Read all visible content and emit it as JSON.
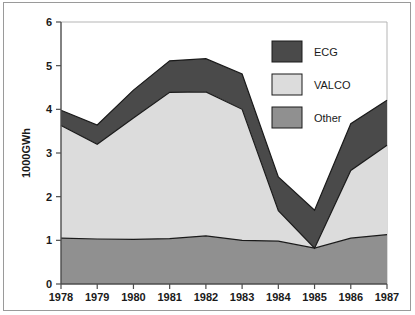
{
  "chart_data": {
    "type": "area",
    "stacked": true,
    "title": "",
    "subtitle": "",
    "xlabel": "",
    "ylabel": "1000GWh",
    "categories": [
      "1978",
      "1979",
      "1980",
      "1981",
      "1982",
      "1983",
      "1984",
      "1985",
      "1986",
      "1987"
    ],
    "x": [
      1978,
      1979,
      1980,
      1981,
      1982,
      1983,
      1984,
      1985,
      1986,
      1987
    ],
    "series": [
      {
        "name": "Other",
        "color": "#909090",
        "values": [
          1.05,
          1.03,
          1.02,
          1.04,
          1.1,
          1.0,
          0.98,
          0.82,
          1.05,
          1.13
        ]
      },
      {
        "name": "VALCO",
        "color": "#dcdcdc",
        "values": [
          2.58,
          2.17,
          2.78,
          3.35,
          3.3,
          3.0,
          0.7,
          0.0,
          1.55,
          2.05
        ]
      },
      {
        "name": "ECG",
        "color": "#4a4a4a",
        "values": [
          0.35,
          0.44,
          0.64,
          0.72,
          0.76,
          0.81,
          0.77,
          0.87,
          1.07,
          1.03
        ]
      }
    ],
    "cumulative_tops": {
      "other": [
        1.05,
        1.03,
        1.02,
        1.04,
        1.1,
        1.0,
        0.98,
        0.82,
        1.05,
        1.13
      ],
      "valco": [
        3.63,
        3.2,
        3.8,
        4.39,
        4.4,
        4.0,
        1.68,
        0.82,
        2.6,
        3.18
      ],
      "ecg": [
        3.98,
        3.64,
        4.44,
        5.11,
        5.16,
        4.81,
        2.45,
        1.69,
        3.67,
        4.21
      ]
    },
    "ylim": [
      0,
      6
    ],
    "xlim": [
      1978,
      1987
    ],
    "ytick_labels": [
      "0",
      "1",
      "2",
      "3",
      "4",
      "5",
      "6"
    ],
    "ytick_values": [
      0,
      1,
      2,
      3,
      4,
      5,
      6
    ],
    "grid": false,
    "legend_position": "top-right",
    "legend_entries": [
      {
        "label": "ECG",
        "color": "#4a4a4a"
      },
      {
        "label": "VALCO",
        "color": "#dcdcdc"
      },
      {
        "label": "Other",
        "color": "#909090"
      }
    ]
  },
  "figure": {
    "frame_color": "#9a9a9a",
    "axis_color": "#4d4d4d",
    "background": "#ffffff"
  }
}
